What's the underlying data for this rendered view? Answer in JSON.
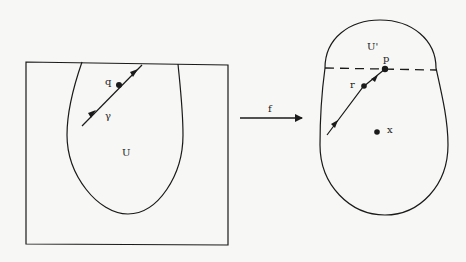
{
  "diagram": {
    "left": {
      "region_label": "U",
      "curve_label": "γ",
      "point_label": "q"
    },
    "map_label": "f",
    "right": {
      "region_label": "U'",
      "point_p_label": "p",
      "point_r_label": "r",
      "point_x_label": "x"
    },
    "colors": {
      "ink": "#1a1a1a",
      "background": "#f7f7f5"
    }
  }
}
